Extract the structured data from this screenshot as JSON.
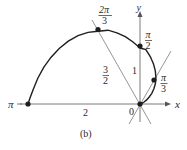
{
  "figure": {
    "caption": "(b)",
    "curve": "r = 1 − cos θ, 0 ≤ θ ≤ π",
    "colors": {
      "curve": "#1e1e1e",
      "axes": "#7a7a7a",
      "lines": "#8a8a8a",
      "points": "#1e1e1e",
      "text": "#2a2a2a"
    },
    "axes": {
      "x_label": "x",
      "y_label": "y",
      "origin_label": "0"
    },
    "angle_labels": {
      "pi": "π",
      "two_pi_over_3": {
        "num": "2π",
        "den": "3"
      },
      "pi_over_2": {
        "num": "π",
        "den": "2"
      },
      "pi_over_3": {
        "num": "π",
        "den": "3"
      }
    },
    "radius_labels": {
      "r_pi": "2",
      "r_two_pi_over_3": {
        "num": "3",
        "den": "2"
      },
      "r_pi_over_2": "1"
    },
    "points": [
      {
        "theta": "π",
        "r": 2
      },
      {
        "theta": "2π/3",
        "r": 1.5
      },
      {
        "theta": "π/2",
        "r": 1
      },
      {
        "theta": "π/3",
        "r": 0.5
      },
      {
        "theta": "0",
        "r": 0
      }
    ]
  }
}
